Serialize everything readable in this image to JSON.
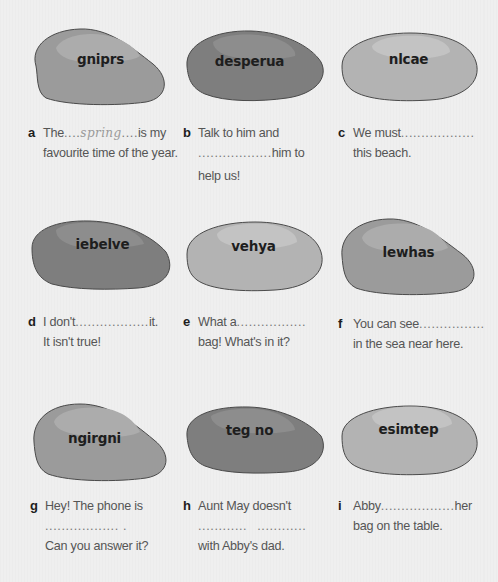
{
  "colors": {
    "background": "#efefef",
    "stone_medium": "#9a9a9a",
    "stone_dark": "#7d7d7d",
    "stone_light": "#b3b3b3",
    "stone_outline": "#4a4a4a",
    "text": "#555555",
    "letter": "#1d1d1d"
  },
  "exercises": [
    {
      "letter": "a",
      "anagram": "gniprs",
      "lines": [
        {
          "before": "The",
          "blank": "....",
          "answer": "spring",
          "blank2": "....",
          "after": "is my"
        },
        {
          "text": "favourite time of the year."
        }
      ]
    },
    {
      "letter": "b",
      "anagram": "desperua",
      "lines": [
        {
          "text": "Talk to him and"
        },
        {
          "blank": "..................",
          "after": "him to"
        },
        {
          "text": "help us!"
        }
      ]
    },
    {
      "letter": "c",
      "anagram": "nlcae",
      "lines": [
        {
          "before": "We must",
          "blank": ".................."
        },
        {
          "text": "this beach."
        }
      ]
    },
    {
      "letter": "d",
      "anagram": "iebelve",
      "lines": [
        {
          "before": "I don't",
          "blank": "..................",
          "after": "it."
        },
        {
          "text": "It isn't true!"
        }
      ]
    },
    {
      "letter": "e",
      "anagram": "vehya",
      "lines": [
        {
          "before": "What a",
          "blank": "................."
        },
        {
          "text": "bag! What's in it?"
        }
      ]
    },
    {
      "letter": "f",
      "anagram": "lewhas",
      "lines": [
        {
          "before": "You can see",
          "blank": "................"
        },
        {
          "text": "in the sea near here."
        }
      ]
    },
    {
      "letter": "g",
      "anagram": "ngirgni",
      "lines": [
        {
          "text": "Hey! The phone is"
        },
        {
          "blank": ".................. ."
        },
        {
          "text": "Can you answer it?"
        }
      ]
    },
    {
      "letter": "h",
      "anagram": "teg no",
      "lines": [
        {
          "text": "Aunt May doesn't"
        },
        {
          "blank": "............",
          "blank2": "............"
        },
        {
          "text": "with Abby's dad."
        }
      ]
    },
    {
      "letter": "i",
      "anagram": "esimtep",
      "lines": [
        {
          "before": "Abby",
          "blank": "..................",
          "after": "her"
        },
        {
          "text": "bag on the table."
        }
      ]
    }
  ]
}
